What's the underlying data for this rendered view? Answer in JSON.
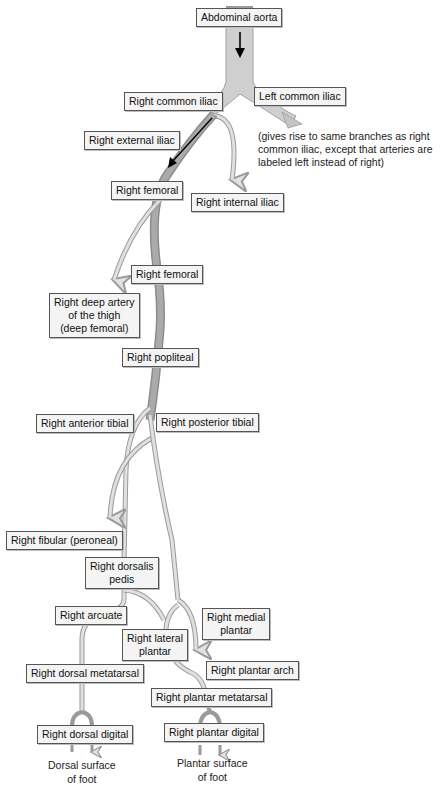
{
  "figure": {
    "colors": {
      "aorta_fill": "#c8c8c8",
      "main_vessel": "#a6a6a6",
      "branch_vessel": "#d4d4d4",
      "vessel_outline": "#8a8a8a",
      "flow_arrow": "#000000",
      "label_bg": "#f4f4f4",
      "label_border": "#555555"
    }
  },
  "labels": {
    "abdominal_aorta": "Abdominal aorta",
    "right_common_iliac": "Right common iliac",
    "left_common_iliac": "Left common iliac",
    "right_external_iliac": "Right external iliac",
    "right_femoral_1": "Right femoral",
    "right_internal_iliac": "Right internal iliac",
    "right_femoral_2": "Right femoral",
    "right_deep_artery": "Right deep artery\nof the thigh\n(deep femoral)",
    "right_popliteal": "Right popliteal",
    "right_anterior_tibial": "Right anterior tibial",
    "right_posterior_tibial": "Right posterior tibial",
    "right_fibular": "Right fibular (peroneal)",
    "right_dorsalis_pedis": "Right dorsalis\npedis",
    "right_arcuate": "Right arcuate",
    "right_medial_plantar": "Right medial\nplantar",
    "right_lateral_plantar": "Right lateral\nplantar",
    "right_plantar_arch": "Right plantar arch",
    "right_dorsal_metatarsal": "Right dorsal metatarsal",
    "right_plantar_metatarsal": "Right plantar metatarsal",
    "right_dorsal_digital": "Right dorsal digital",
    "right_plantar_digital": "Right plantar digital"
  },
  "notes": {
    "left_iliac_note": "(gives rise to same branches as right\ncommon iliac, except that arteries are\nlabeled left instead of right)"
  },
  "captions": {
    "dorsal_surface": "Dorsal surface\nof foot",
    "plantar_surface": "Plantar surface\nof foot"
  },
  "icons": {
    "flow_arrow": "down-arrow-icon",
    "branch_arrow": "open-arrowhead-icon"
  }
}
